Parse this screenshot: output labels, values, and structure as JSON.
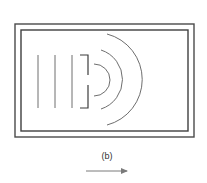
{
  "figure": {
    "label": "(b)",
    "colors": {
      "frame": "#4a4a4a",
      "waves": "#6e6e6e",
      "barrier": "#3c3c3c",
      "arrow": "#7a7a7a"
    },
    "elements": {
      "frame": "double rectangular border",
      "incident_wavefronts": 3,
      "barrier": "bracket-shaped barrier with a central slit",
      "diffracted_wavefronts": 3,
      "arrow": "rightward arrow indicating direction of propagation"
    }
  }
}
